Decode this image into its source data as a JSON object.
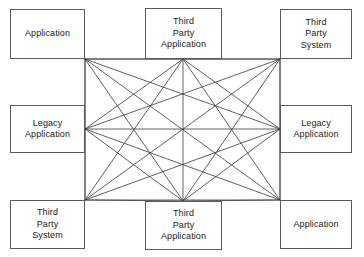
{
  "diagram": {
    "type": "node-mesh",
    "canvas": {
      "width": 364,
      "height": 257,
      "background": "#ffffff"
    },
    "style": {
      "node_border_color": "#5a5a5a",
      "node_fill_color": "#ffffff",
      "edge_color": "#3a3a3a",
      "edge_width": 0.8,
      "text_color": "#1a1a1a"
    },
    "nodes": [
      {
        "id": "top-left",
        "label": "Application",
        "x": 10,
        "y": 9,
        "w": 75,
        "h": 50,
        "anchor_x": 85,
        "anchor_y": 59
      },
      {
        "id": "top-center",
        "label": "Third\nParty\nApplication",
        "x": 145,
        "y": 8,
        "w": 77,
        "h": 51,
        "anchor_x": 183,
        "anchor_y": 59
      },
      {
        "id": "top-right",
        "label": "Third\nParty\nSystem",
        "x": 280,
        "y": 9,
        "w": 72,
        "h": 50,
        "anchor_x": 280,
        "anchor_y": 59
      },
      {
        "id": "mid-left",
        "label": "Legacy\nApplication",
        "x": 10,
        "y": 105,
        "w": 75,
        "h": 48,
        "anchor_x": 85,
        "anchor_y": 129
      },
      {
        "id": "mid-right",
        "label": "Legacy\nApplication",
        "x": 280,
        "y": 105,
        "w": 72,
        "h": 48,
        "anchor_x": 280,
        "anchor_y": 129
      },
      {
        "id": "bottom-left",
        "label": "Third\nParty\nSystem",
        "x": 10,
        "y": 200,
        "w": 75,
        "h": 49,
        "anchor_x": 85,
        "anchor_y": 200
      },
      {
        "id": "bottom-center",
        "label": "Third\nParty\nApplication",
        "x": 145,
        "y": 201,
        "w": 77,
        "h": 49,
        "anchor_x": 183,
        "anchor_y": 201
      },
      {
        "id": "bottom-right",
        "label": "Application",
        "x": 280,
        "y": 200,
        "w": 72,
        "h": 49,
        "anchor_x": 280,
        "anchor_y": 200
      }
    ],
    "edges": [
      [
        "top-left",
        "top-center"
      ],
      [
        "top-left",
        "top-right"
      ],
      [
        "top-left",
        "mid-left"
      ],
      [
        "top-left",
        "mid-right"
      ],
      [
        "top-left",
        "bottom-left"
      ],
      [
        "top-left",
        "bottom-center"
      ],
      [
        "top-left",
        "bottom-right"
      ],
      [
        "top-center",
        "top-right"
      ],
      [
        "top-center",
        "mid-left"
      ],
      [
        "top-center",
        "mid-right"
      ],
      [
        "top-center",
        "bottom-left"
      ],
      [
        "top-center",
        "bottom-center"
      ],
      [
        "top-center",
        "bottom-right"
      ],
      [
        "top-right",
        "mid-left"
      ],
      [
        "top-right",
        "mid-right"
      ],
      [
        "top-right",
        "bottom-left"
      ],
      [
        "top-right",
        "bottom-center"
      ],
      [
        "top-right",
        "bottom-right"
      ],
      [
        "mid-left",
        "mid-right"
      ],
      [
        "mid-left",
        "bottom-left"
      ],
      [
        "mid-left",
        "bottom-center"
      ],
      [
        "mid-left",
        "bottom-right"
      ],
      [
        "mid-right",
        "bottom-left"
      ],
      [
        "mid-right",
        "bottom-center"
      ],
      [
        "mid-right",
        "bottom-right"
      ],
      [
        "bottom-left",
        "bottom-center"
      ],
      [
        "bottom-left",
        "bottom-right"
      ],
      [
        "bottom-center",
        "bottom-right"
      ]
    ],
    "edge_count": 28,
    "node_count": 8
  }
}
